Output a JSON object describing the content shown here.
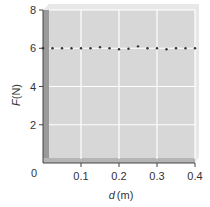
{
  "chart_data": {
    "type": "scatter",
    "title": "",
    "xlabel": "d (m)",
    "xlabel_var": "d",
    "xlabel_unit": "(m)",
    "ylabel": "F (N)",
    "ylabel_var": "F",
    "ylabel_unit": "(N)",
    "xlim": [
      0,
      0.4
    ],
    "ylim": [
      0,
      8
    ],
    "x_ticks": [
      0.1,
      0.2,
      0.3,
      0.4
    ],
    "x_tick_labels": [
      "0.1",
      "0.2",
      "0.3",
      "0.4"
    ],
    "y_ticks": [
      2,
      4,
      6,
      8
    ],
    "y_tick_labels": [
      "2",
      "4",
      "6",
      "8"
    ],
    "origin_label": "0",
    "grid": true,
    "legend": null,
    "series": [
      {
        "name": "F vs d",
        "marker": "dot",
        "color": "#333333",
        "x": [
          0.0,
          0.025,
          0.05,
          0.075,
          0.1,
          0.125,
          0.15,
          0.175,
          0.2,
          0.225,
          0.25,
          0.275,
          0.3,
          0.325,
          0.35,
          0.375,
          0.4
        ],
        "y": [
          6.0,
          6.0,
          6.0,
          6.0,
          6.0,
          6.0,
          6.05,
          6.0,
          5.95,
          5.97,
          6.1,
          6.0,
          6.0,
          5.95,
          6.0,
          6.0,
          6.0
        ]
      }
    ],
    "colors": {
      "panel": "#d9d9d9",
      "panel_edge": "#a6a6a6",
      "grid": "#ffffff",
      "axis": "#444444"
    }
  }
}
